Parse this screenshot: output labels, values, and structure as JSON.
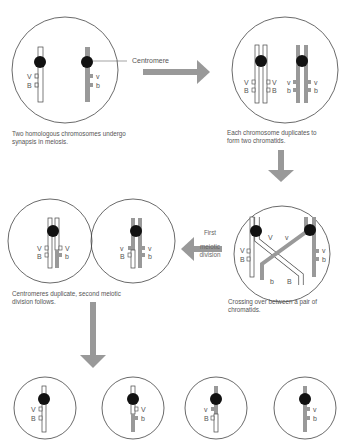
{
  "colors": {
    "background": "#ffffff",
    "outline": "#444444",
    "gray_chromosome": "#999999",
    "centromere": "#111111",
    "arrow": "#999999",
    "text": "#555555"
  },
  "labels": {
    "centromere": "Centromere",
    "first_meiotic_division_line1": "First",
    "first_meiotic_division_line2": "meiotic",
    "first_meiotic_division_line3": "division"
  },
  "steps": [
    {
      "id": 1,
      "caption_line1": "Two homologous chromosomes undergo",
      "caption_line2": "synapsis in meiosis."
    },
    {
      "id": 2,
      "caption_line1": "Each chromosome duplicates to",
      "caption_line2": "form two chromatids."
    },
    {
      "id": 3,
      "caption_line1": "Crossing over between a pair of",
      "caption_line2": "chromatids."
    },
    {
      "id": 4,
      "caption_line1": "Centromeres duplicate, second meiotic",
      "caption_line2": "division follows."
    }
  ],
  "genes": {
    "white_v": "V",
    "white_b": "B",
    "gray_v": "v",
    "gray_b": "b"
  },
  "final_gametes": [
    {
      "v": "V",
      "b": "B",
      "type": "parental-white"
    },
    {
      "v": "V",
      "b": "b",
      "type": "recombinant"
    },
    {
      "v": "v",
      "b": "B",
      "type": "recombinant"
    },
    {
      "v": "v",
      "b": "b",
      "type": "parental-gray"
    }
  ]
}
